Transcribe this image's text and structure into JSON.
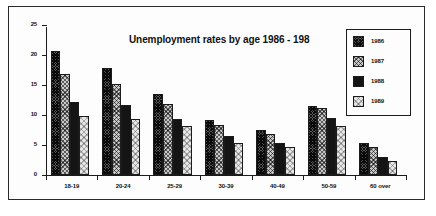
{
  "chart_data": {
    "type": "bar",
    "title": "Unemployment rates by age 1986 - 198",
    "xlabel": "",
    "ylabel": "",
    "ylim": [
      0,
      25
    ],
    "yticks": [
      0,
      5,
      10,
      15,
      20,
      25
    ],
    "grid": false,
    "legend_position": "top-right",
    "categories": [
      "18-19",
      "20-24",
      "25-29",
      "30-39",
      "40-49",
      "50-59",
      "60 over"
    ],
    "series": [
      {
        "name": "1986",
        "values": [
          20.7,
          17.8,
          13.5,
          9.2,
          7.5,
          11.5,
          5.3
        ],
        "swatch": "dark-crosshatch"
      },
      {
        "name": "1987",
        "values": [
          16.8,
          15.2,
          11.8,
          8.3,
          6.8,
          11.1,
          4.7
        ],
        "swatch": "mid-checker"
      },
      {
        "name": "1988",
        "values": [
          12.2,
          11.7,
          9.4,
          6.5,
          5.4,
          9.5,
          3.0
        ],
        "swatch": "solid-black"
      },
      {
        "name": "1989",
        "values": [
          9.8,
          9.4,
          8.2,
          5.4,
          4.7,
          8.1,
          2.4
        ],
        "swatch": "light-dots"
      }
    ]
  }
}
